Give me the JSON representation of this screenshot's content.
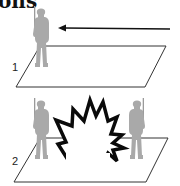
{
  "heading": {
    "text": "ons"
  },
  "panels": [
    {
      "number": "1",
      "description": "Single soldier standing on ground plane, arrow pointing toward soldier"
    },
    {
      "number": "2",
      "description": "Two soldiers facing each other with explosion between them"
    }
  ],
  "colors": {
    "silhouette": "#a9a9a9",
    "outline": "#1a1a1a",
    "explosion_fill": "#ffffff",
    "background": "#ffffff"
  },
  "icons": {
    "arrow": "arrow-left-icon",
    "explosion": "explosion-icon",
    "soldier": "soldier-silhouette-icon"
  }
}
